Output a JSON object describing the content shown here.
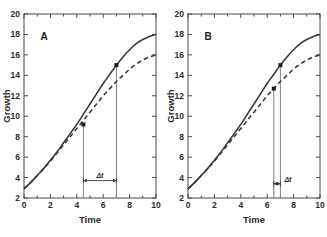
{
  "figure": {
    "background_color": "#ffffff",
    "curve_color": "#3a3a3a",
    "axis_color": "#4a4a4a",
    "guide_color": "#808080",
    "width": 327,
    "height": 237
  },
  "chart_data": [
    {
      "type": "line",
      "panel_label": "A",
      "title": "",
      "xlabel": "Time",
      "ylabel": "Growth",
      "xlim": [
        0,
        10
      ],
      "ylim": [
        2,
        20
      ],
      "xticks": [
        0,
        2,
        4,
        6,
        8,
        10
      ],
      "xtick_labels": [
        "0",
        "2",
        "4",
        "6",
        "8",
        "10"
      ],
      "yticks": [
        2,
        4,
        6,
        8,
        10,
        12,
        14,
        16,
        18,
        20
      ],
      "ytick_labels": [
        "2",
        "4",
        "6",
        "8",
        "10",
        "12",
        "14",
        "16",
        "18",
        "20"
      ],
      "grid": false,
      "legend": null,
      "series": [
        {
          "name": "solid",
          "style": "solid",
          "x": [
            0,
            0.5,
            1,
            1.5,
            2,
            2.5,
            3,
            3.5,
            4,
            4.5,
            5,
            5.5,
            6,
            6.5,
            7,
            7.5,
            8,
            8.5,
            9,
            9.5,
            10
          ],
          "y": [
            2.9,
            3.5,
            4.2,
            4.9,
            5.7,
            6.5,
            7.4,
            8.3,
            9.2,
            10.2,
            11.2,
            12.2,
            13.2,
            14.1,
            15.0,
            15.8,
            16.5,
            17.1,
            17.5,
            17.8,
            18.0
          ]
        },
        {
          "name": "dashed",
          "style": "dashed",
          "x": [
            0,
            0.5,
            1,
            1.5,
            2,
            2.5,
            3,
            3.5,
            4,
            4.5,
            5,
            5.5,
            6,
            6.5,
            7,
            7.5,
            8,
            8.5,
            9,
            9.5,
            10
          ],
          "y": [
            2.9,
            3.5,
            4.2,
            4.9,
            5.6,
            6.4,
            7.2,
            8.0,
            8.8,
            9.6,
            10.4,
            11.2,
            12.0,
            12.7,
            13.4,
            14.0,
            14.6,
            15.1,
            15.5,
            15.8,
            16.0
          ]
        }
      ],
      "markers": [
        {
          "x": 4.5,
          "y": 9.2
        },
        {
          "x": 7.0,
          "y": 15.0
        }
      ],
      "vertical_lines": [
        {
          "x": 4.5,
          "y_from": 2.0,
          "y_to": 9.2
        },
        {
          "x": 7.0,
          "y_from": 2.0,
          "y_to": 15.0
        }
      ],
      "annotations": [
        {
          "text": "Δt",
          "x_from": 4.5,
          "x_to": 7.0,
          "y": 3.7,
          "kind": "double-arrow"
        }
      ]
    },
    {
      "type": "line",
      "panel_label": "B",
      "title": "",
      "xlabel": "Time",
      "ylabel": "Growth",
      "xlim": [
        0,
        10
      ],
      "ylim": [
        2,
        20
      ],
      "xticks": [
        0,
        2,
        4,
        6,
        8,
        10
      ],
      "xtick_labels": [
        "0",
        "2",
        "4",
        "6",
        "8",
        "10"
      ],
      "yticks": [
        2,
        4,
        6,
        8,
        10,
        12,
        14,
        16,
        18,
        20
      ],
      "ytick_labels": [
        "2",
        "4",
        "6",
        "8",
        "10",
        "12",
        "14",
        "16",
        "18",
        "20"
      ],
      "grid": false,
      "legend": null,
      "series": [
        {
          "name": "solid",
          "style": "solid",
          "x": [
            0,
            0.5,
            1,
            1.5,
            2,
            2.5,
            3,
            3.5,
            4,
            4.5,
            5,
            5.5,
            6,
            6.5,
            7,
            7.5,
            8,
            8.5,
            9,
            9.5,
            10
          ],
          "y": [
            2.9,
            3.5,
            4.2,
            4.9,
            5.7,
            6.5,
            7.4,
            8.3,
            9.2,
            10.2,
            11.2,
            12.2,
            13.2,
            14.1,
            15.0,
            15.8,
            16.5,
            17.1,
            17.5,
            17.8,
            18.0
          ]
        },
        {
          "name": "dashed",
          "style": "dashed",
          "x": [
            0,
            0.5,
            1,
            1.5,
            2,
            2.5,
            3,
            3.5,
            4,
            4.5,
            5,
            5.5,
            6,
            6.5,
            7,
            7.5,
            8,
            8.5,
            9,
            9.5,
            10
          ],
          "y": [
            2.9,
            3.5,
            4.2,
            4.9,
            5.6,
            6.4,
            7.2,
            8.0,
            8.8,
            9.6,
            10.4,
            11.2,
            12.0,
            12.7,
            13.4,
            14.0,
            14.6,
            15.1,
            15.5,
            15.8,
            16.0
          ]
        }
      ],
      "markers": [
        {
          "x": 6.5,
          "y": 12.7
        },
        {
          "x": 7.0,
          "y": 15.0
        }
      ],
      "vertical_lines": [
        {
          "x": 6.5,
          "y_from": 2.0,
          "y_to": 12.7
        },
        {
          "x": 7.0,
          "y_from": 2.0,
          "y_to": 15.0
        }
      ],
      "annotations": [
        {
          "text": "Δt",
          "x_from": 6.5,
          "x_to": 7.0,
          "y": 3.4,
          "kind": "double-arrow",
          "label_side": "right"
        }
      ]
    }
  ]
}
